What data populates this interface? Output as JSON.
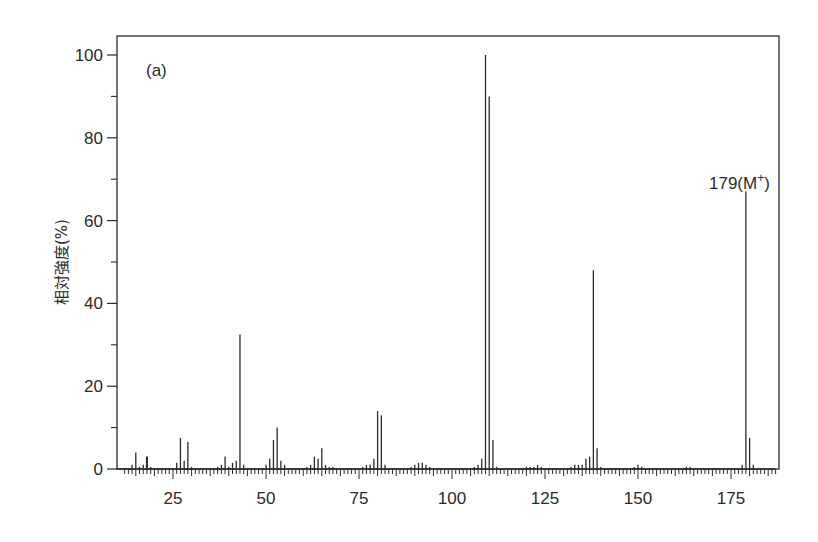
{
  "chart_data": {
    "type": "bar",
    "subtype": "mass-spectrum-stick",
    "panel_label": "(a)",
    "title": "",
    "xlabel": "",
    "ylabel": "相対強度(%)",
    "xlim": [
      10,
      187
    ],
    "ylim": [
      0,
      103
    ],
    "x_major_ticks": [
      25,
      50,
      75,
      100,
      125,
      150,
      175
    ],
    "x_tick_labels": [
      "25",
      "50",
      "75",
      "100",
      "125",
      "150",
      "175"
    ],
    "x_minor_tick_step": 1,
    "y_major_ticks": [
      0,
      20,
      40,
      60,
      80,
      100
    ],
    "y_tick_labels": [
      "0",
      "20",
      "40",
      "60",
      "80",
      "100"
    ],
    "y_minor_ticks": [
      10,
      30,
      50,
      70,
      90
    ],
    "grid": false,
    "legend": null,
    "annotations": [
      {
        "text": "179(M",
        "superscript": "+",
        "suffix": ")",
        "x": 179,
        "y": 67
      }
    ],
    "peaks": [
      {
        "mz": 14,
        "intensity": 1.0
      },
      {
        "mz": 15,
        "intensity": 4.0
      },
      {
        "mz": 16,
        "intensity": 0.5
      },
      {
        "mz": 17,
        "intensity": 1.0
      },
      {
        "mz": 18,
        "intensity": 3.0
      },
      {
        "mz": 19,
        "intensity": 0.5
      },
      {
        "mz": 26,
        "intensity": 1.5
      },
      {
        "mz": 27,
        "intensity": 7.5
      },
      {
        "mz": 28,
        "intensity": 2.0
      },
      {
        "mz": 29,
        "intensity": 6.5
      },
      {
        "mz": 30,
        "intensity": 0.5
      },
      {
        "mz": 37,
        "intensity": 0.5
      },
      {
        "mz": 38,
        "intensity": 1.0
      },
      {
        "mz": 39,
        "intensity": 3.0
      },
      {
        "mz": 40,
        "intensity": 0.5
      },
      {
        "mz": 41,
        "intensity": 1.5
      },
      {
        "mz": 42,
        "intensity": 2.0
      },
      {
        "mz": 43,
        "intensity": 32.5
      },
      {
        "mz": 44,
        "intensity": 1.0
      },
      {
        "mz": 50,
        "intensity": 1.0
      },
      {
        "mz": 51,
        "intensity": 2.5
      },
      {
        "mz": 52,
        "intensity": 7.0
      },
      {
        "mz": 53,
        "intensity": 10.0
      },
      {
        "mz": 54,
        "intensity": 2.0
      },
      {
        "mz": 55,
        "intensity": 1.0
      },
      {
        "mz": 61,
        "intensity": 0.5
      },
      {
        "mz": 62,
        "intensity": 1.0
      },
      {
        "mz": 63,
        "intensity": 3.0
      },
      {
        "mz": 64,
        "intensity": 2.5
      },
      {
        "mz": 65,
        "intensity": 5.0
      },
      {
        "mz": 66,
        "intensity": 1.0
      },
      {
        "mz": 67,
        "intensity": 0.5
      },
      {
        "mz": 68,
        "intensity": 0.5
      },
      {
        "mz": 76,
        "intensity": 0.5
      },
      {
        "mz": 77,
        "intensity": 1.0
      },
      {
        "mz": 78,
        "intensity": 1.0
      },
      {
        "mz": 79,
        "intensity": 2.5
      },
      {
        "mz": 80,
        "intensity": 14.0
      },
      {
        "mz": 81,
        "intensity": 13.0
      },
      {
        "mz": 82,
        "intensity": 1.0
      },
      {
        "mz": 89,
        "intensity": 0.5
      },
      {
        "mz": 90,
        "intensity": 1.0
      },
      {
        "mz": 91,
        "intensity": 1.5
      },
      {
        "mz": 92,
        "intensity": 1.5
      },
      {
        "mz": 93,
        "intensity": 1.0
      },
      {
        "mz": 94,
        "intensity": 0.5
      },
      {
        "mz": 106,
        "intensity": 0.5
      },
      {
        "mz": 107,
        "intensity": 1.0
      },
      {
        "mz": 108,
        "intensity": 2.5
      },
      {
        "mz": 109,
        "intensity": 100.0
      },
      {
        "mz": 110,
        "intensity": 90.0
      },
      {
        "mz": 111,
        "intensity": 7.0
      },
      {
        "mz": 112,
        "intensity": 0.5
      },
      {
        "mz": 120,
        "intensity": 0.5
      },
      {
        "mz": 121,
        "intensity": 0.5
      },
      {
        "mz": 122,
        "intensity": 0.5
      },
      {
        "mz": 123,
        "intensity": 1.0
      },
      {
        "mz": 124,
        "intensity": 0.5
      },
      {
        "mz": 132,
        "intensity": 0.5
      },
      {
        "mz": 133,
        "intensity": 1.0
      },
      {
        "mz": 134,
        "intensity": 1.0
      },
      {
        "mz": 135,
        "intensity": 1.0
      },
      {
        "mz": 136,
        "intensity": 2.5
      },
      {
        "mz": 137,
        "intensity": 3.0
      },
      {
        "mz": 138,
        "intensity": 48.0
      },
      {
        "mz": 139,
        "intensity": 5.0
      },
      {
        "mz": 140,
        "intensity": 0.5
      },
      {
        "mz": 149,
        "intensity": 0.5
      },
      {
        "mz": 150,
        "intensity": 1.0
      },
      {
        "mz": 151,
        "intensity": 0.5
      },
      {
        "mz": 163,
        "intensity": 0.5
      },
      {
        "mz": 164,
        "intensity": 0.5
      },
      {
        "mz": 178,
        "intensity": 1.0
      },
      {
        "mz": 179,
        "intensity": 67.0
      },
      {
        "mz": 180,
        "intensity": 7.5
      },
      {
        "mz": 181,
        "intensity": 1.0
      }
    ]
  },
  "colors": {
    "ink": "#2a2a2a",
    "background": "#ffffff"
  }
}
